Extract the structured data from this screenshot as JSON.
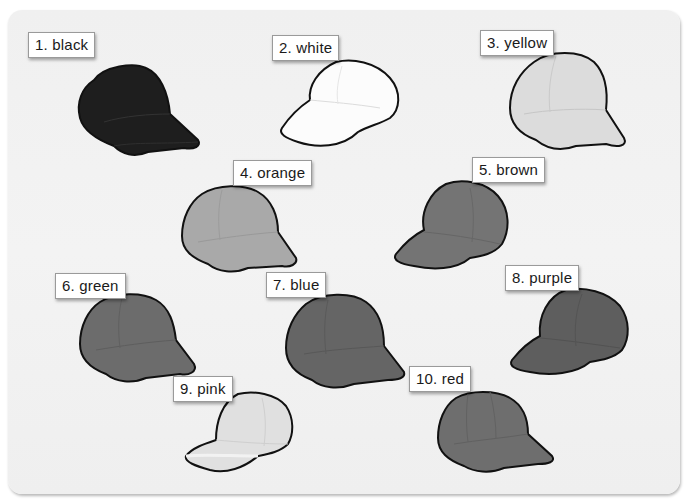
{
  "figure": {
    "items": [
      {
        "number": "1",
        "label": "1. black",
        "color_name": "black",
        "shade": "#1e1e1e",
        "brim": "#2a2a2a",
        "facing": "right"
      },
      {
        "number": "2",
        "label": "2. white",
        "color_name": "white",
        "shade": "#fbfbfb",
        "brim": "#ffffff",
        "facing": "left"
      },
      {
        "number": "3",
        "label": "3. yellow",
        "color_name": "yellow",
        "shade": "#d9d9d9",
        "brim": "#e4e4e4",
        "facing": "right"
      },
      {
        "number": "4",
        "label": "4. orange",
        "color_name": "orange",
        "shade": "#a9a9a9",
        "brim": "#b8b8b8",
        "facing": "right"
      },
      {
        "number": "5",
        "label": "5. brown",
        "color_name": "brown",
        "shade": "#747474",
        "brim": "#808080",
        "facing": "left"
      },
      {
        "number": "6",
        "label": "6. green",
        "color_name": "green",
        "shade": "#6c6c6c",
        "brim": "#7a7a7a",
        "facing": "right"
      },
      {
        "number": "7",
        "label": "7. blue",
        "color_name": "blue",
        "shade": "#656565",
        "brim": "#757575",
        "facing": "right"
      },
      {
        "number": "8",
        "label": "8. purple",
        "color_name": "purple",
        "shade": "#5e5e5e",
        "brim": "#6c6c6c",
        "facing": "left"
      },
      {
        "number": "9",
        "label": "9. pink",
        "color_name": "pink",
        "shade": "#dedede",
        "brim": "#eeeeee",
        "facing": "left"
      },
      {
        "number": "10",
        "label": "10. red",
        "color_name": "red",
        "shade": "#6e6e6e",
        "brim": "#7c7c7c",
        "facing": "right"
      }
    ]
  },
  "colors": {
    "panel_background": "#f0f0f0",
    "label_background": "#ffffff",
    "label_border": "#9a9a9a",
    "outline": "#111111"
  }
}
